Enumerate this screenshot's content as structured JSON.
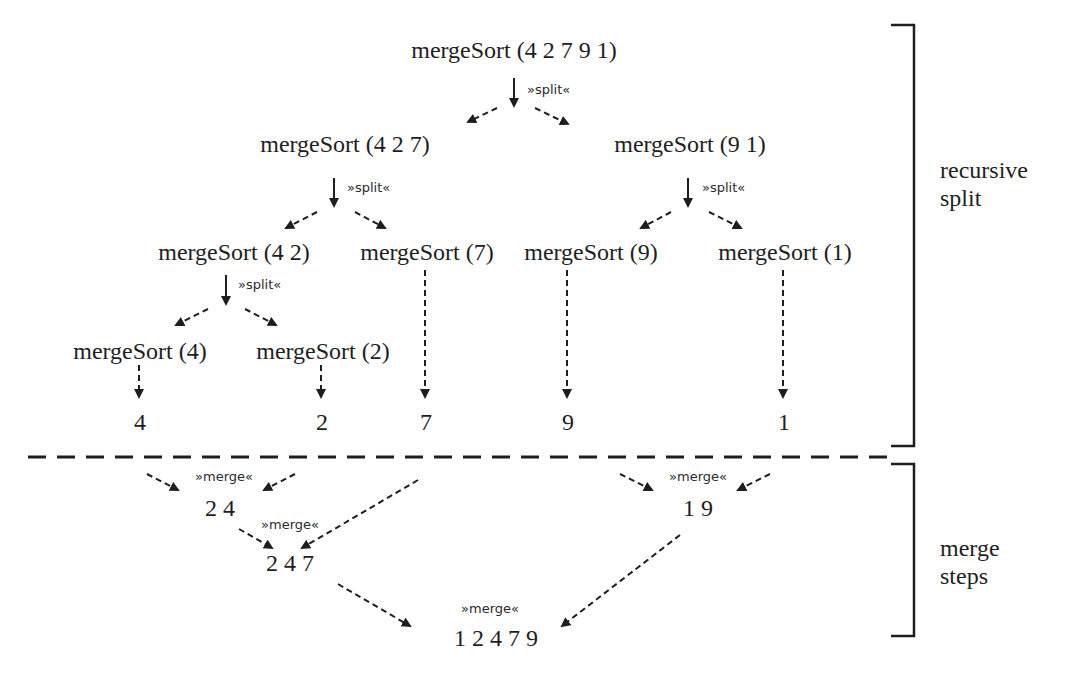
{
  "diagram": {
    "title_node": "mergeSort (4 2 7 9 1)",
    "split_label": "»split«",
    "merge_label": "»merge«",
    "split_tree": {
      "root": "mergeSort (4 2 7 9 1)",
      "level1": [
        "mergeSort (4 2 7)",
        "mergeSort (9 1)"
      ],
      "level2": [
        "mergeSort (4 2)",
        "mergeSort (7)",
        "mergeSort (9)",
        "mergeSort (1)"
      ],
      "level3": [
        "mergeSort (4)",
        "mergeSort (2)"
      ],
      "leaves": [
        "4",
        "2",
        "7",
        "9",
        "1"
      ]
    },
    "merge_steps": {
      "step1_left": "2 4",
      "step1_right": "1 9",
      "step2": "2 4 7",
      "final": "1 2 4 7 9"
    },
    "side_labels": {
      "recursive_split": "recursive\nsplit",
      "merge_steps": "merge\nsteps"
    },
    "colors": {
      "ink": "#1e1e1e",
      "background": "#ffffff"
    }
  }
}
